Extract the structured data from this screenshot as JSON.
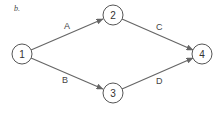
{
  "panel_label": "b.",
  "nodes": [
    {
      "id": "1",
      "label": "1",
      "x": 22,
      "y": 54
    },
    {
      "id": "2",
      "label": "2",
      "x": 113,
      "y": 15
    },
    {
      "id": "3",
      "label": "3",
      "x": 113,
      "y": 93
    },
    {
      "id": "4",
      "label": "4",
      "x": 202,
      "y": 54
    }
  ],
  "edges": [
    {
      "label": "A",
      "from": "1",
      "to": "2"
    },
    {
      "label": "B",
      "from": "1",
      "to": "3"
    },
    {
      "label": "C",
      "from": "2",
      "to": "4"
    },
    {
      "label": "D",
      "from": "3",
      "to": "4"
    }
  ],
  "colors": {
    "stroke": "#555555",
    "edge": "#666666",
    "text": "#333333"
  }
}
